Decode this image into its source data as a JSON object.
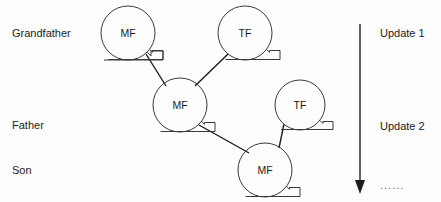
{
  "diagram": {
    "background_color": "#fdfdfd",
    "stroke_color": "#3a3a3a",
    "text_color": "#1b1b1b",
    "row_labels": [
      {
        "id": "grandfather",
        "text": "Grandfather",
        "x": 12,
        "y": 28
      },
      {
        "id": "father",
        "text": "Father",
        "x": 12,
        "y": 120
      },
      {
        "id": "son",
        "text": "Son",
        "x": 12,
        "y": 165
      }
    ],
    "nodes": [
      {
        "id": "node-grandfather-mf",
        "label": "MF",
        "cx": 128,
        "cy": 33,
        "r": 27
      },
      {
        "id": "node-grandfather-tf",
        "label": "TF",
        "cx": 245,
        "cy": 33,
        "r": 27
      },
      {
        "id": "node-father-mf",
        "label": "MF",
        "cx": 180,
        "cy": 105,
        "r": 27
      },
      {
        "id": "node-father-tf",
        "label": "TF",
        "cx": 300,
        "cy": 105,
        "r": 25
      },
      {
        "id": "node-son-mf",
        "label": "MF",
        "cx": 265,
        "cy": 170,
        "r": 27
      }
    ],
    "edges": [
      {
        "id": "edge-gf-mf-to-father-mf",
        "x1": 146,
        "y1": 54,
        "x2": 166,
        "y2": 86
      },
      {
        "id": "edge-gf-tf-to-father-mf",
        "x1": 228,
        "y1": 54,
        "x2": 195,
        "y2": 86
      },
      {
        "id": "edge-father-mf-to-son-mf",
        "x1": 199,
        "y1": 125,
        "x2": 249,
        "y2": 153
      },
      {
        "id": "edge-father-tf-to-son-mf",
        "x1": 283,
        "y1": 124,
        "x2": 278,
        "y2": 147
      }
    ],
    "timeline": {
      "id": "update-axis",
      "x": 360,
      "y_top": 24,
      "y_bottom": 192,
      "updates": [
        {
          "id": "update-1",
          "text": "Update 1",
          "x": 380,
          "y": 28
        },
        {
          "id": "update-2",
          "text": "Update 2",
          "x": 380,
          "y": 121
        }
      ],
      "ellipsis": {
        "id": "timeline-ellipsis",
        "text": "......",
        "x": 380,
        "y": 180
      }
    }
  }
}
